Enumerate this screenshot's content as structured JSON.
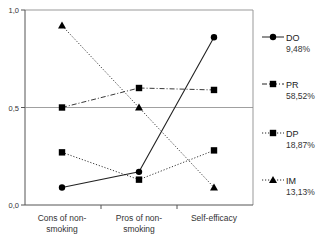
{
  "chart_data": {
    "type": "line",
    "title": "",
    "xlabel": "",
    "ylabel": "",
    "ylim": [
      0,
      1
    ],
    "yticks": [
      "0,0",
      "0,5",
      "1,0"
    ],
    "grid": "horizontal line at 0,5 only",
    "legend_position": "right",
    "categories": [
      [
        "Cons of non-",
        "smoking"
      ],
      [
        "Pros of non-",
        "smoking"
      ],
      [
        "Self-efficacy"
      ]
    ],
    "series": [
      {
        "name": "DO",
        "percent": "9,48%",
        "marker": "circle",
        "line": "solid",
        "values": [
          0.09,
          0.17,
          0.86
        ]
      },
      {
        "name": "PR",
        "percent": "58,52%",
        "marker": "square",
        "line": "dash-dot",
        "values": [
          0.5,
          0.6,
          0.59
        ]
      },
      {
        "name": "DP",
        "percent": "18,87%",
        "marker": "square",
        "line": "dotted",
        "values": [
          0.27,
          0.13,
          0.28
        ]
      },
      {
        "name": "IM",
        "percent": "13,13%",
        "marker": "triangle",
        "line": "dotted",
        "values": [
          0.92,
          0.5,
          0.09
        ]
      }
    ]
  }
}
